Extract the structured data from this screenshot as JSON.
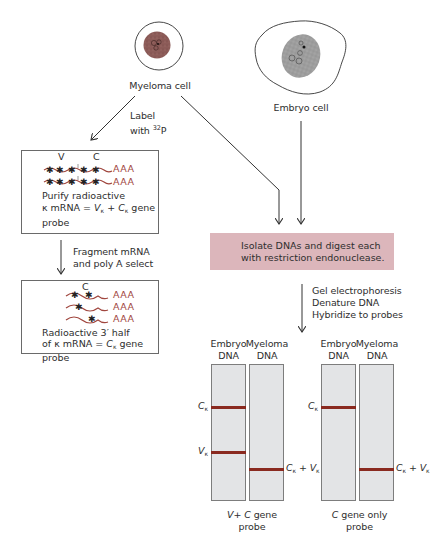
{
  "figure": {
    "cells": {
      "myeloma": {
        "label": "Myeloma cell"
      },
      "embryo": {
        "label": "Embryo cell"
      }
    },
    "steps": {
      "label_step": {
        "line1": "Label",
        "line2_prefix": "with ",
        "isotope_mass": "32",
        "isotope_symbol": "P"
      },
      "fragment_step": {
        "line1": "Fragment mRNA",
        "line2": "and poly A select"
      },
      "gel_step": {
        "line1": "Gel electrophoresis",
        "line2": "Denature DNA",
        "line3": "Hybridize to probes"
      }
    },
    "box_probe_full": {
      "segment_labels": {
        "v": "V",
        "c": "C"
      },
      "tail": "AAA",
      "line1": "Purify radioactive",
      "line2_prefix": "κ mRNA = ",
      "v_symbol": "V",
      "plus": " + ",
      "c_symbol": "C",
      "kappa_sub": "κ",
      "line2_suffix": " gene",
      "line3": "probe"
    },
    "box_probe_c": {
      "segment_label": "C",
      "tail": "AAA",
      "line1": "Radioactive 3′ half",
      "line2_prefix": "of κ mRNA = ",
      "c_symbol": "C",
      "kappa_sub": "κ",
      "line2_suffix": " gene",
      "line3": "probe"
    },
    "isolate_box": {
      "line1": "Isolate DNAs and digest each",
      "line2": "with restriction endonuclease.",
      "color": "#dcb6bb"
    },
    "gels": [
      {
        "lanes": [
          {
            "header1": "Embryo",
            "header2": "DNA",
            "bands": [
              "C_kappa",
              "V_kappa"
            ]
          },
          {
            "header1": "Myeloma",
            "header2": "DNA",
            "bands": [
              "C_kappa + V_kappa"
            ]
          }
        ],
        "caption_line1_v": "V",
        "caption_line1_plus": "+ ",
        "caption_line1_c": "C",
        "caption_line1_rest": " gene",
        "caption_line2": "probe",
        "left_band_labels": {
          "c": "C",
          "v": "V",
          "sub": "κ"
        },
        "right_band_label": {
          "c": "C",
          "plus": " + ",
          "v": "V",
          "sub": "κ"
        }
      },
      {
        "lanes": [
          {
            "header1": "Embryo",
            "header2": "DNA",
            "bands": [
              "C_kappa"
            ]
          },
          {
            "header1": "Myeloma",
            "header2": "DNA",
            "bands": [
              "C_kappa + V_kappa"
            ]
          }
        ],
        "caption_line1_c": "C",
        "caption_line1_rest": " gene only",
        "caption_line2": "probe",
        "left_band_labels": {
          "c": "C",
          "sub": "κ"
        },
        "right_band_label": {
          "c": "C",
          "plus": " + ",
          "v": "V",
          "sub": "κ"
        }
      }
    ],
    "colors": {
      "band": "#8a2a20",
      "mrna": "#a0463e",
      "myeloma_nucleus": "#8a5a58",
      "embryo_nucleus": "#9c9c9c",
      "lane_fill": "#e3e4e6"
    }
  }
}
